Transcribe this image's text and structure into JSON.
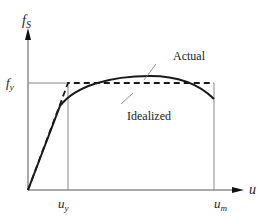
{
  "diagram": {
    "type": "force-displacement curve",
    "y_axis": {
      "label": "f",
      "label_sub": "S"
    },
    "x_axis": {
      "label": "u"
    },
    "ticks": {
      "fy": {
        "label": "f",
        "sub": "y"
      },
      "uy": {
        "label": "u",
        "sub": "y"
      },
      "um": {
        "label": "u",
        "sub": "m"
      }
    },
    "curves": [
      {
        "name": "Actual",
        "style": "solid"
      },
      {
        "name": "Idealized",
        "style": "dashed"
      }
    ],
    "annotations": {
      "actual": "Actual",
      "idealized": "Idealized"
    },
    "colors": {
      "line": "#1a1a1a",
      "axis": "#555555",
      "guide": "#888888"
    }
  }
}
